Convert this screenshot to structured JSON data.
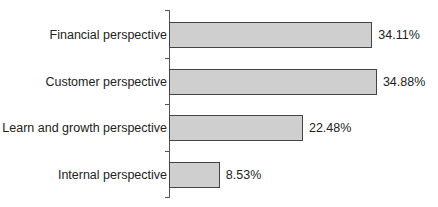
{
  "chart_data": {
    "type": "bar",
    "orientation": "horizontal",
    "title": "",
    "xlabel": "",
    "ylabel": "",
    "categories": [
      "Financial perspective",
      "Customer perspective",
      "Learn and growth perspective",
      "Internal perspective"
    ],
    "values": [
      34.11,
      34.88,
      22.48,
      8.53
    ],
    "value_labels": [
      "34.11%",
      "34.88%",
      "22.48%",
      "8.53%"
    ],
    "unit": "%",
    "xlim": [
      0,
      40
    ],
    "grid": false,
    "legend": null,
    "bar_color": "#cfcfcf",
    "bar_edge_color": "#444444"
  }
}
